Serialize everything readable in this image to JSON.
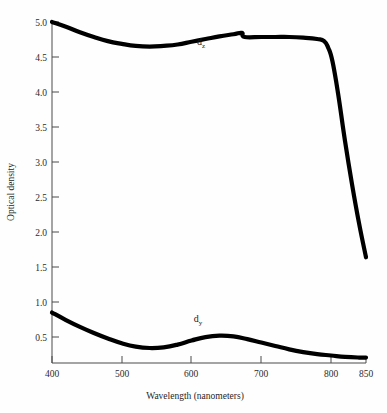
{
  "chart_data": {
    "type": "line",
    "title": "",
    "subtitle": "",
    "xlabel": "Wavelength (nanometers)",
    "ylabel": "Optical density",
    "xlim": [
      400,
      850
    ],
    "ylim": [
      0,
      5.0
    ],
    "grid": false,
    "legend_position": "inline-annotations",
    "xticks": [
      400,
      500,
      600,
      700,
      800,
      850
    ],
    "xtick_labels": [
      "400",
      "500",
      "600",
      "700",
      "800",
      "850"
    ],
    "yticks": [
      0.5,
      1.0,
      1.5,
      2.0,
      2.5,
      3.0,
      3.5,
      4.0,
      4.5,
      5.0
    ],
    "ytick_labels": [
      "0.5",
      "1.0",
      "1.5",
      "2.0",
      "2.5",
      "3.0",
      "3.5",
      "4.0",
      "4.5",
      "5.0"
    ],
    "series": [
      {
        "name": "d_z",
        "label_text": "d",
        "label_sub": "z",
        "color": "#000000",
        "x": [
          400,
          420,
          440,
          460,
          480,
          500,
          520,
          540,
          560,
          580,
          600,
          620,
          640,
          660,
          672,
          676,
          700,
          720,
          740,
          760,
          780,
          790,
          796,
          802,
          810,
          820,
          830,
          840,
          850
        ],
        "y": [
          5.0,
          4.93,
          4.85,
          4.78,
          4.72,
          4.68,
          4.65,
          4.64,
          4.65,
          4.67,
          4.71,
          4.75,
          4.79,
          4.82,
          4.84,
          4.78,
          4.78,
          4.78,
          4.78,
          4.77,
          4.75,
          4.72,
          4.62,
          4.42,
          3.95,
          3.25,
          2.62,
          2.05,
          1.55
        ]
      },
      {
        "name": "d_y",
        "label_text": "d",
        "label_sub": "y",
        "color": "#000000",
        "x": [
          400,
          420,
          440,
          460,
          480,
          500,
          520,
          540,
          560,
          580,
          600,
          620,
          640,
          660,
          680,
          700,
          720,
          740,
          760,
          780,
          800,
          820,
          840,
          850
        ],
        "y": [
          0.74,
          0.63,
          0.53,
          0.44,
          0.36,
          0.29,
          0.24,
          0.22,
          0.23,
          0.27,
          0.33,
          0.38,
          0.4,
          0.39,
          0.35,
          0.3,
          0.25,
          0.2,
          0.16,
          0.13,
          0.11,
          0.09,
          0.08,
          0.08
        ]
      }
    ],
    "annotations": [
      {
        "text": "d",
        "sub": "z",
        "x": 645,
        "y": 4.42
      },
      {
        "text": "d",
        "sub": "y",
        "x": 628,
        "y": 0.72
      }
    ]
  },
  "axes": {
    "y_title": "Optical density",
    "x_title": "Wavelength (nanometers)"
  }
}
